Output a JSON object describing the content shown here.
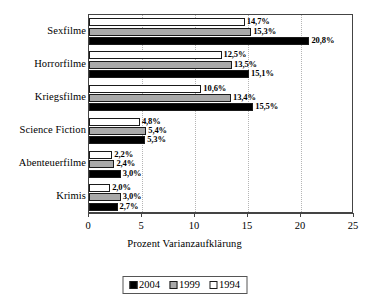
{
  "chart_data": {
    "type": "bar",
    "orientation": "horizontal",
    "title": "",
    "xlabel": "Prozent Varianzaufklärung",
    "ylabel": "",
    "xlim": [
      0,
      25
    ],
    "xticks": [
      "0",
      "5",
      "10",
      "15",
      "20",
      "25"
    ],
    "grid": "vertical-dotted",
    "legend_position": "bottom",
    "categories": [
      "Sexfilme",
      "Horrorfilme",
      "Kriegsfilme",
      "Science Fiction",
      "Abenteuerfilme",
      "Krimis"
    ],
    "series": [
      {
        "name": "2004",
        "color": "#000000",
        "values": [
          20.8,
          15.1,
          15.5,
          5.3,
          3.0,
          2.7
        ],
        "labels": [
          "20,8%",
          "15,1%",
          "15,5%",
          "5,3%",
          "3,0%",
          "2,7%"
        ]
      },
      {
        "name": "1999",
        "color": "#a9a9a9",
        "values": [
          15.3,
          13.5,
          13.4,
          5.4,
          2.4,
          3.0
        ],
        "labels": [
          "15,3%",
          "13,5%",
          "13,4%",
          "5,4%",
          "2,4%",
          "3,0%"
        ]
      },
      {
        "name": "1994",
        "color": "#ffffff",
        "values": [
          14.7,
          12.5,
          10.6,
          4.8,
          2.2,
          2.0
        ],
        "labels": [
          "14,7%",
          "12,5%",
          "10,6%",
          "4,8%",
          "2,2%",
          "2,0%"
        ]
      }
    ],
    "series_draw_order_top_to_bottom": [
      "1994",
      "1999",
      "2004"
    ],
    "gridline_values": [
      5,
      10,
      15,
      20
    ]
  },
  "legend": {
    "items": [
      {
        "label": "2004",
        "key": "s2004"
      },
      {
        "label": "1999",
        "key": "s1999"
      },
      {
        "label": "1994",
        "key": "s1994"
      }
    ]
  }
}
